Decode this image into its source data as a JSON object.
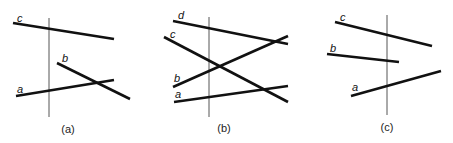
{
  "panels": [
    {
      "caption": "(a)",
      "caption_pos": [
        68,
        133
      ],
      "sweep_line": [
        49,
        18,
        49,
        117
      ],
      "segments": [
        {
          "label": "c",
          "line": [
            13,
            23,
            114,
            39
          ],
          "label_pos": [
            17,
            22
          ]
        },
        {
          "label": "b",
          "line": [
            57,
            63,
            130,
            99
          ],
          "label_pos": [
            62,
            62
          ]
        },
        {
          "label": "a",
          "line": [
            16,
            96,
            114,
            80
          ],
          "label_pos": [
            17,
            93
          ]
        }
      ]
    },
    {
      "caption": "(b)",
      "caption_pos": [
        224,
        132
      ],
      "sweep_line": [
        209,
        17,
        209,
        117
      ],
      "segments": [
        {
          "label": "d",
          "line": [
            173,
            21,
            288,
            44
          ],
          "label_pos": [
            178,
            19
          ]
        },
        {
          "label": "c",
          "line": [
            164,
            37,
            288,
            102
          ],
          "label_pos": [
            170,
            38
          ]
        },
        {
          "label": "b",
          "line": [
            173,
            87,
            288,
            36
          ],
          "label_pos": [
            174,
            82
          ]
        },
        {
          "label": "a",
          "line": [
            174,
            102,
            288,
            86
          ],
          "label_pos": [
            175,
            98
          ]
        }
      ]
    },
    {
      "caption": "(c)",
      "caption_pos": [
        387,
        131
      ],
      "sweep_line": [
        387,
        15,
        387,
        115
      ],
      "segments": [
        {
          "label": "c",
          "line": [
            335,
            22,
            432,
            46
          ],
          "label_pos": [
            340,
            21
          ]
        },
        {
          "label": "b",
          "line": [
            327,
            54,
            399,
            62
          ],
          "label_pos": [
            330,
            52
          ]
        },
        {
          "label": "a",
          "line": [
            351,
            96,
            441,
            71
          ],
          "label_pos": [
            352,
            91
          ]
        }
      ]
    }
  ]
}
